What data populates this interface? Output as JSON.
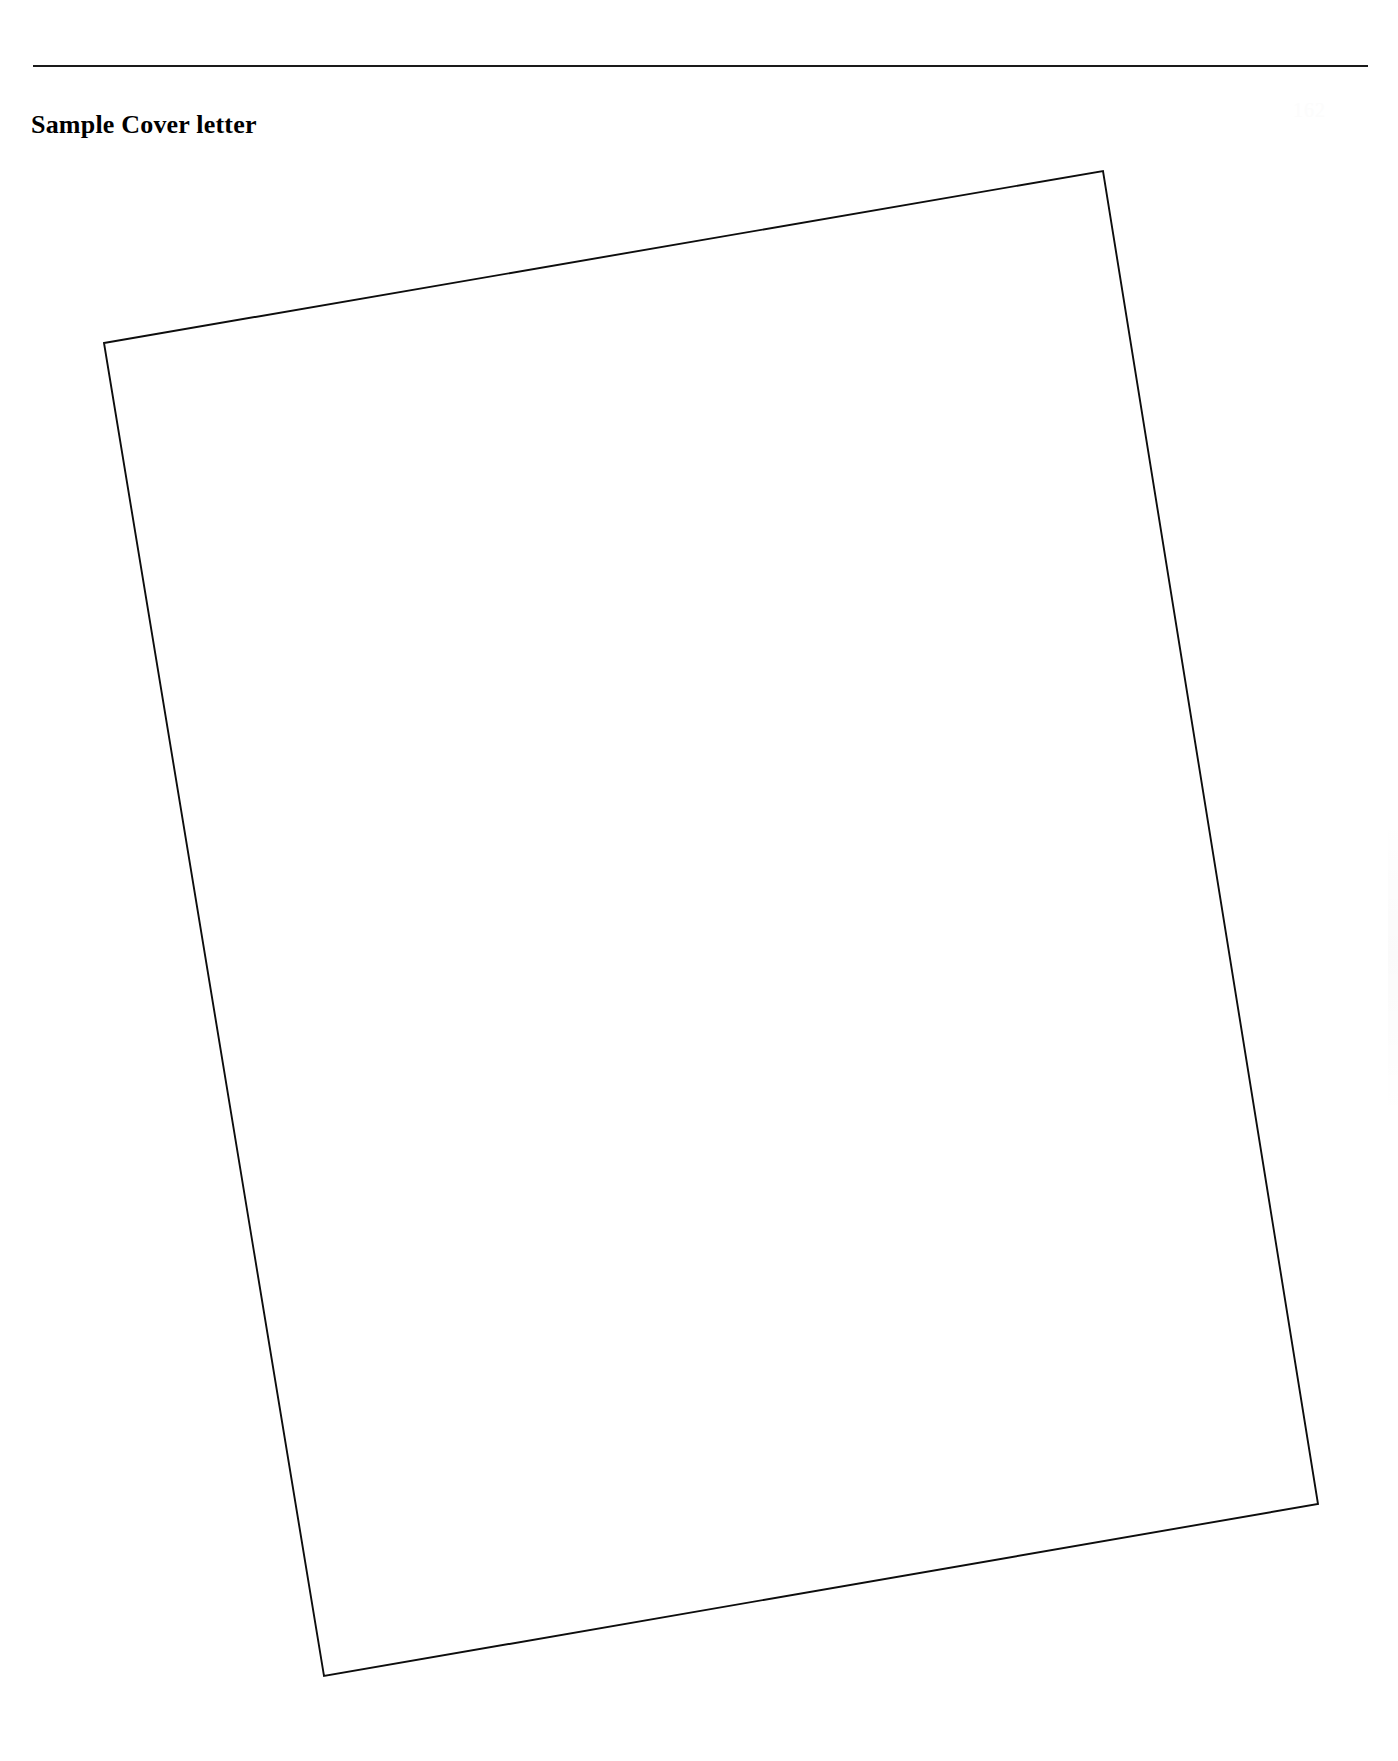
{
  "document": {
    "background_color": "#ffffff",
    "width": 1398,
    "height": 1761
  },
  "header": {
    "rule": {
      "name": "header-divider-rule",
      "color": "#1a1a1a",
      "x": 33,
      "y": 65,
      "width": 1335,
      "thickness": 2
    },
    "title": "Sample Cover letter",
    "folio_artifact": "162"
  },
  "content": {
    "scanned_sheet": {
      "description": "blank rotated scanned page outline",
      "stroke_color": "#0d0d0d",
      "fill_color": "#ffffff",
      "stroke_width": 1.9,
      "rotation_degrees": -9.8,
      "corners": {
        "top_left": [
          104,
          343
        ],
        "top_right": [
          1103,
          171
        ],
        "bottom_right": [
          1318,
          1504
        ],
        "bottom_left": [
          324,
          1676
        ]
      },
      "body_text": ""
    }
  }
}
